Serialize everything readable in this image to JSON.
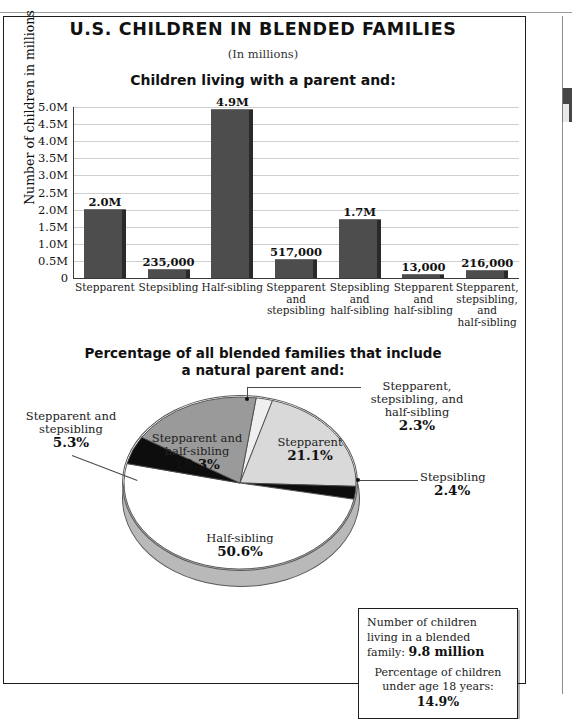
{
  "page": {
    "main_title": "U.S. CHILDREN IN BLENDED FAMILIES",
    "subtitle": "(In millions)"
  },
  "bar_section": {
    "heading": "Children living with a parent and:",
    "y_axis_label": "Number of children in millions"
  },
  "pie_section": {
    "heading_line1": "Percentage of all blended families that include",
    "heading_line2": "a natural parent and:"
  },
  "info_box": {
    "line1_text": "Number of children living in a blended family: ",
    "line1_value": "9.8 million",
    "line2_text": "Percentage of children under age 18 years: ",
    "line2_value": "14.9%"
  },
  "colors": {
    "bar_fill": "#4d4d4d",
    "bar_side": "#2a2a2a",
    "gridline": "#cfcfcf",
    "axis": "#3a3a3a",
    "slice_stepparent": "#d9d9d9",
    "slice_stepsibling": "#0d0d0d",
    "slice_halfsibling": "#ffffff",
    "slice_stepparent_stepsibling": "#0d0d0d",
    "slice_stepparent_halfsibling": "#9a9a9a",
    "slice_all_three": "#efefef",
    "pie_depth": "#b9b9b9"
  },
  "chart_data": [
    {
      "type": "bar",
      "title": "Children living with a parent and:",
      "subtitle": "(In millions)",
      "xlabel": "",
      "ylabel": "Number of children in millions",
      "ylim": [
        0,
        5000000
      ],
      "ytick_labels": [
        "5.0M",
        "4.5M",
        "4.0M",
        "3.5M",
        "3.0M",
        "2.5M",
        "2.0M",
        "1.5M",
        "1.0M",
        "0.5M",
        "0"
      ],
      "ytick_values": [
        5000000,
        4500000,
        4000000,
        3500000,
        3000000,
        2500000,
        2000000,
        1500000,
        1000000,
        500000,
        0
      ],
      "grid": true,
      "legend": "none",
      "categories": [
        "Stepparent",
        "Stepsibling",
        "Half-sibling",
        "Stepparent and stepsibling",
        "Stepsibling and half-sibling",
        "Stepparent and half-sibling",
        "Stepparent, stepsibling, and half-sibling"
      ],
      "category_lines": [
        [
          "Stepparent"
        ],
        [
          "Stepsibling"
        ],
        [
          "Half-sibling"
        ],
        [
          "Stepparent",
          "and",
          "stepsibling"
        ],
        [
          "Stepsibling",
          "and",
          "half-sibling"
        ],
        [
          "Stepparent",
          "and",
          "half-sibling"
        ],
        [
          "Stepparent,",
          "stepsibling,",
          "and",
          "half-sibling"
        ]
      ],
      "values": [
        2000000,
        235000,
        4900000,
        517000,
        1700000,
        13000,
        216000
      ],
      "data_labels": [
        "2.0M",
        "235,000",
        "4.9M",
        "517,000",
        "1.7M",
        "13,000",
        "216,000"
      ]
    },
    {
      "type": "pie",
      "title": "Percentage of all blended families that include a natural parent and:",
      "legend": "callout-labels",
      "unit": "%",
      "labels": [
        "Stepparent",
        "Stepsibling",
        "Half-sibling",
        "Stepparent and stepsibling",
        "Stepparent and half-sibling",
        "Stepparent, stepsibling, and half-sibling"
      ],
      "values": [
        21.1,
        2.4,
        50.6,
        5.3,
        18.3,
        2.3
      ],
      "data_labels": [
        "21.1%",
        "2.4%",
        "50.6%",
        "5.3%",
        "18.3%",
        "2.3%"
      ],
      "slices": [
        {
          "name": "Stepparent, stepsibling, and half-sibling",
          "value": 2.3,
          "label": "2.3%",
          "color": "#efefef",
          "callout": true
        },
        {
          "name": "Stepparent",
          "value": 21.1,
          "label": "21.1%",
          "color": "#d9d9d9",
          "callout": false
        },
        {
          "name": "Stepsibling",
          "value": 2.4,
          "label": "2.4%",
          "color": "#0d0d0d",
          "callout": true
        },
        {
          "name": "Half-sibling",
          "value": 50.6,
          "label": "50.6%",
          "color": "#ffffff",
          "callout": false
        },
        {
          "name": "Stepparent and stepsibling",
          "value": 5.3,
          "label": "5.3%",
          "color": "#0d0d0d",
          "callout": true
        },
        {
          "name": "Stepparent and half-sibling",
          "value": 18.3,
          "label": "18.3%",
          "color": "#9a9a9a",
          "callout": false
        }
      ]
    }
  ],
  "pie_labels": {
    "all_three_l1": "Stepparent,",
    "all_three_l2": "stepsibling, and",
    "all_three_l3": "half-sibling",
    "all_three_pct": "2.3%",
    "stepparent_name": "Stepparent",
    "stepparent_pct": "21.1%",
    "stepsibling_name": "Stepsibling",
    "stepsibling_pct": "2.4%",
    "halfsibling_name": "Half-sibling",
    "halfsibling_pct": "50.6%",
    "sp_ss_l1": "Stepparent and",
    "sp_ss_l2": "stepsibling",
    "sp_ss_pct": "5.3%",
    "sp_hs_l1": "Stepparent and",
    "sp_hs_l2": "half-sibling",
    "sp_hs_pct": "18.3%"
  }
}
